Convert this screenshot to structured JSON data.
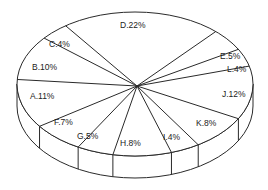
{
  "chart_data": {
    "type": "pie",
    "style": "3d-exploded-none",
    "title": "",
    "legend": "none",
    "labels_format": "Category.Percent%",
    "slices": [
      {
        "label": "D",
        "value": 22,
        "text": "D.22%"
      },
      {
        "label": "E",
        "value": 5,
        "text": "E.5%"
      },
      {
        "label": "L",
        "value": 4,
        "text": "L.4%"
      },
      {
        "label": "J",
        "value": 12,
        "text": "J.12%"
      },
      {
        "label": "K",
        "value": 8,
        "text": "K.8%"
      },
      {
        "label": "I",
        "value": 4,
        "text": "I.4%"
      },
      {
        "label": "H",
        "value": 8,
        "text": "H.8%"
      },
      {
        "label": "G",
        "value": 5,
        "text": "G.5%"
      },
      {
        "label": "F",
        "value": 7,
        "text": "F.7%"
      },
      {
        "label": "A",
        "value": 11,
        "text": "A.11%"
      },
      {
        "label": "B",
        "value": 10,
        "text": "B.10%"
      },
      {
        "label": "C",
        "value": 4,
        "text": "C.4%"
      }
    ],
    "colors": {
      "fill": "#ffffff",
      "stroke": "#2a2a2a",
      "text": "#222222"
    }
  }
}
